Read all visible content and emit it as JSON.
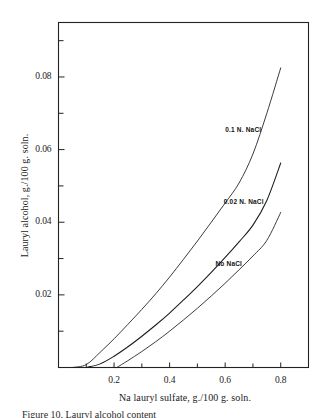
{
  "figure": {
    "caption": "Figure 10. Lauryl alcohol content"
  },
  "chart_data": {
    "type": "line",
    "title": "",
    "xlabel": "Na lauryl sulfate, g./100 g. soln.",
    "ylabel": "Lauryl alcohol, g./100 g. soln.",
    "xlim": [
      0.0,
      0.9
    ],
    "ylim": [
      0.0,
      0.095
    ],
    "grid": false,
    "legend_position": "inline-right",
    "x_ticks_major": [
      0.2,
      0.4,
      0.6,
      0.8
    ],
    "x_tick_labels": [
      "0.2",
      "0.4",
      "0.6",
      "0.8"
    ],
    "x_ticks_minor": [
      0.1,
      0.3,
      0.5,
      0.7
    ],
    "y_ticks_major": [
      0.02,
      0.04,
      0.06,
      0.08
    ],
    "y_tick_labels": [
      "0.02",
      "0.04",
      "0.06",
      "0.08"
    ],
    "y_ticks_minor": [
      0.01,
      0.03,
      0.05,
      0.07,
      0.09
    ],
    "series": [
      {
        "name": "0.1 N. NaCl",
        "label_x": 0.6,
        "label_y": 0.0655,
        "x": [
          0.05,
          0.1,
          0.15,
          0.2,
          0.25,
          0.3,
          0.35,
          0.4,
          0.45,
          0.5,
          0.55,
          0.6,
          0.65,
          0.7,
          0.75,
          0.8
        ],
        "y": [
          0.0,
          0.0008,
          0.0042,
          0.0079,
          0.0119,
          0.016,
          0.0203,
          0.0249,
          0.0298,
          0.0348,
          0.04,
          0.0453,
          0.0508,
          0.0588,
          0.07,
          0.0825
        ]
      },
      {
        "name": "0.02 N. NaCl",
        "label_x": 0.595,
        "label_y": 0.0455,
        "x": [
          0.1,
          0.15,
          0.2,
          0.25,
          0.3,
          0.35,
          0.4,
          0.45,
          0.5,
          0.55,
          0.6,
          0.65,
          0.7,
          0.75,
          0.8
        ],
        "y": [
          0.0,
          0.001,
          0.0031,
          0.0057,
          0.0086,
          0.0117,
          0.015,
          0.0186,
          0.0223,
          0.0262,
          0.0303,
          0.0346,
          0.0392,
          0.046,
          0.0563
        ]
      },
      {
        "name": "No NaCl",
        "label_x": 0.565,
        "label_y": 0.0285,
        "x": [
          0.21,
          0.25,
          0.3,
          0.35,
          0.4,
          0.45,
          0.5,
          0.55,
          0.6,
          0.65,
          0.7,
          0.75,
          0.8
        ],
        "y": [
          0.0,
          0.0019,
          0.0044,
          0.0071,
          0.01,
          0.0131,
          0.0163,
          0.0197,
          0.0232,
          0.0269,
          0.0307,
          0.035,
          0.0427
        ]
      }
    ]
  },
  "axes": {
    "frame_color": "#222222"
  }
}
